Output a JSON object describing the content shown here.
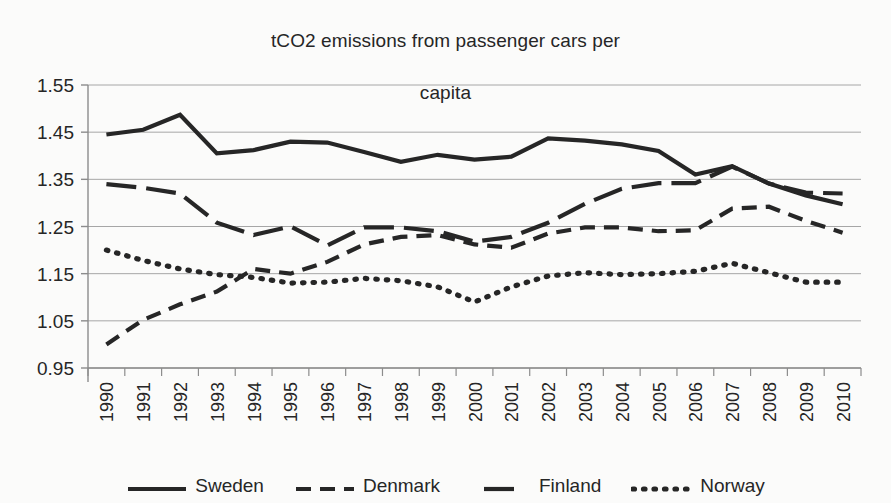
{
  "chart_data": {
    "type": "line",
    "title": "tCO2 emissions from passenger cars per capita",
    "title_line1": "tCO2 emissions from passenger cars per",
    "title_line2": "capita",
    "xlabel": "",
    "ylabel": "",
    "grid": true,
    "legend_position": "bottom",
    "ylim": [
      0.95,
      1.55
    ],
    "yticks": [
      "0.95",
      "1.05",
      "1.15",
      "1.25",
      "1.35",
      "1.45",
      "1.55"
    ],
    "ytick_values": [
      0.95,
      1.05,
      1.15,
      1.25,
      1.35,
      1.45,
      1.55
    ],
    "categories": [
      "1990",
      "1991",
      "1992",
      "1993",
      "1994",
      "1995",
      "1996",
      "1997",
      "1998",
      "1999",
      "2000",
      "2001",
      "2002",
      "2003",
      "2004",
      "2005",
      "2006",
      "2007",
      "2008",
      "2009",
      "2010"
    ],
    "x": [
      1990,
      1991,
      1992,
      1993,
      1994,
      1995,
      1996,
      1997,
      1998,
      1999,
      2000,
      2001,
      2002,
      2003,
      2004,
      2005,
      2006,
      2007,
      2008,
      2009,
      2010
    ],
    "series": [
      {
        "name": "Sweden",
        "style": "solid",
        "color": "#262626",
        "values": [
          1.445,
          1.455,
          1.487,
          1.405,
          1.412,
          1.43,
          1.428,
          1.408,
          1.387,
          1.402,
          1.392,
          1.398,
          1.437,
          1.432,
          1.424,
          1.41,
          1.36,
          1.378,
          1.341,
          1.316,
          1.297
        ]
      },
      {
        "name": "Denmark",
        "style": "dashed",
        "color": "#262626",
        "values": [
          1.0,
          1.052,
          1.085,
          1.112,
          1.16,
          1.15,
          1.175,
          1.212,
          1.228,
          1.232,
          1.212,
          1.205,
          1.235,
          1.248,
          1.248,
          1.24,
          1.242,
          1.288,
          1.292,
          1.262,
          1.237
        ]
      },
      {
        "name": "Finland",
        "style": "longdash",
        "color": "#262626",
        "values": [
          1.34,
          1.332,
          1.32,
          1.258,
          1.232,
          1.25,
          1.21,
          1.248,
          1.248,
          1.24,
          1.218,
          1.228,
          1.258,
          1.298,
          1.33,
          1.342,
          1.342,
          1.377,
          1.341,
          1.322,
          1.32
        ]
      },
      {
        "name": "Norway",
        "style": "dotted",
        "color": "#262626",
        "values": [
          1.2,
          1.178,
          1.16,
          1.148,
          1.142,
          1.13,
          1.132,
          1.14,
          1.135,
          1.122,
          1.09,
          1.122,
          1.145,
          1.152,
          1.148,
          1.15,
          1.155,
          1.172,
          1.152,
          1.132,
          1.132
        ]
      }
    ]
  },
  "legend": {
    "items": [
      {
        "label": "Sweden"
      },
      {
        "label": "Denmark"
      },
      {
        "label": "Finland"
      },
      {
        "label": "Norway"
      }
    ]
  }
}
